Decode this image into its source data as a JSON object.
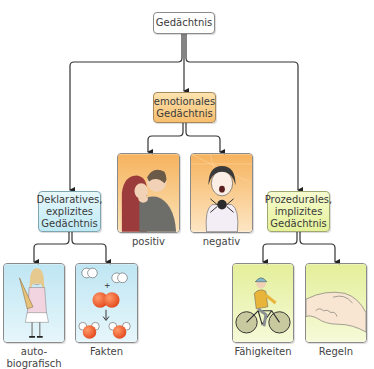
{
  "diagram": {
    "root": {
      "label": "Gedächtnis"
    },
    "emotional": {
      "label_line1": "emotionales",
      "label_line2": "Gedächtnis",
      "children": [
        {
          "label": "positiv",
          "illustration": "kissing-couple"
        },
        {
          "label": "negativ",
          "illustration": "girl-with-spider"
        }
      ]
    },
    "declarative": {
      "label_line1": "Deklaratives,",
      "label_line2": "explizites",
      "label_line3": "Gedächtnis",
      "children": [
        {
          "label_line1": "auto-",
          "label_line2": "biografisch",
          "illustration": "girl-with-school-cone"
        },
        {
          "label": "Fakten",
          "illustration": "molecule-reaction"
        }
      ]
    },
    "procedural": {
      "label_line1": "Prozedurales,",
      "label_line2": "implizites",
      "label_line3": "Gedächtnis",
      "children": [
        {
          "label": "Fähigkeiten",
          "illustration": "cyclist"
        },
        {
          "label": "Regeln",
          "illustration": "handshake"
        }
      ]
    },
    "colors": {
      "root_fill": "#ffffff",
      "emotional_fill": "#f7be6e",
      "declarative_fill": "#bfe9f4",
      "procedural_fill": "#e5f29a",
      "connector": "#222222"
    }
  }
}
